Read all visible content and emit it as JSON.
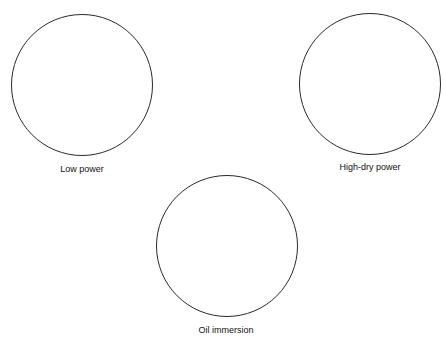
{
  "diagram": {
    "fields": [
      {
        "label": "Low power",
        "cx": 82,
        "cy": 85,
        "r": 71
      },
      {
        "label": "High-dry power",
        "cx": 370,
        "cy": 84,
        "r": 71
      },
      {
        "label": "Oil immersion",
        "cx": 226,
        "cy": 246,
        "r": 71
      }
    ]
  },
  "colors": {
    "stroke": "#2a2a2a",
    "background": "#ffffff",
    "text": "#111111"
  }
}
